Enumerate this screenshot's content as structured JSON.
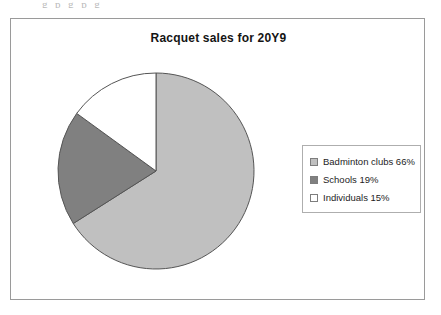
{
  "page": {
    "clipped_text_above": "g p g p g"
  },
  "chart_frame": {
    "border_color": "#9a9a9a",
    "background": "#ffffff"
  },
  "legend": {
    "position": "right",
    "border_color": "#aeaeae",
    "entries": [
      {
        "label": "Badminton clubs 66%",
        "color": "#c0c0c0",
        "swatch_name": "legend-swatch-badminton-clubs"
      },
      {
        "label": "Schools 19%",
        "color": "#808080",
        "swatch_name": "legend-swatch-schools"
      },
      {
        "label": "Individuals 15%",
        "color": "#ffffff",
        "swatch_name": "legend-swatch-individuals"
      }
    ]
  },
  "chart_data": {
    "type": "pie",
    "title": "Racquet sales for 20Y9",
    "xlabel": "",
    "ylabel": "",
    "categories": [
      "Badminton clubs",
      "Schools",
      "Individuals"
    ],
    "values": [
      66,
      19,
      15
    ],
    "unit": "%",
    "labels": [
      "Badminton clubs 66%",
      "Schools 19%",
      "Individuals 15%"
    ],
    "colors": [
      "#c0c0c0",
      "#808080",
      "#ffffff"
    ],
    "slice_border_color": "#555555",
    "start_angle_deg": 0,
    "direction": "clockwise",
    "legend_position": "right",
    "grid": false,
    "data_labels_on_slices": false
  }
}
